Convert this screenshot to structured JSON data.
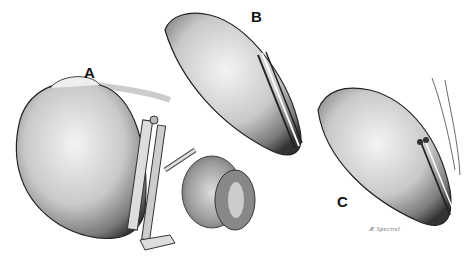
{
  "figure": {
    "panels": [
      {
        "label": "A",
        "content": "Organ with clamp instrument applied and tissue patch alongside"
      },
      {
        "label": "B",
        "content": "Organ with longitudinal incision closed by parallel strips"
      },
      {
        "label": "C",
        "content": "Organ with sutured closure and suture threads at upper right"
      }
    ],
    "signature": "Æ Spectrel",
    "colors": {
      "background": "#ffffff",
      "ink": "#1a1a1a",
      "shade_dark": "#555555",
      "shade_mid": "#999999",
      "shade_light": "#d8d8d8"
    }
  }
}
